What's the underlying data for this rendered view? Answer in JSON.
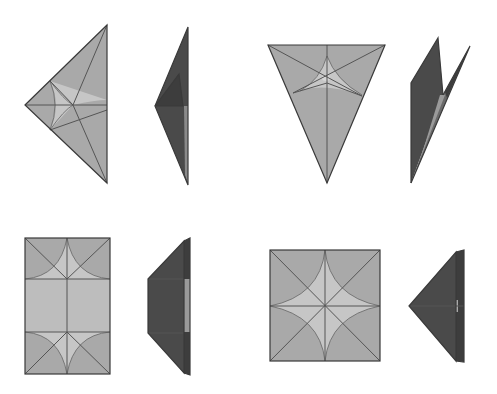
{
  "diagram": {
    "type": "origami-fold-steps",
    "background": "#ffffff",
    "colors": {
      "paper_light": "#a9a9a9",
      "paper_highlight": "#c6c6c6",
      "paper_dark": "#4a4a4a",
      "line": "#3a3a3a"
    },
    "steps": [
      {
        "id": "step-1",
        "shape": "triangle pointing left, crease pattern",
        "view": "flat"
      },
      {
        "id": "step-1-side",
        "shape": "folded dark flap, pointing left",
        "view": "side"
      },
      {
        "id": "step-2",
        "shape": "inverted triangle, crease pattern",
        "view": "flat"
      },
      {
        "id": "step-2-side",
        "shape": "folded dark model with two upward points",
        "view": "side"
      },
      {
        "id": "step-3",
        "shape": "rectangle with curved crease arcs",
        "view": "flat"
      },
      {
        "id": "step-3-side",
        "shape": "trapezoid dark flap",
        "view": "side"
      },
      {
        "id": "step-4",
        "shape": "square with four-point star crease pattern",
        "view": "flat"
      },
      {
        "id": "step-4-side",
        "shape": "dark triangle pointing left",
        "view": "side"
      }
    ]
  }
}
